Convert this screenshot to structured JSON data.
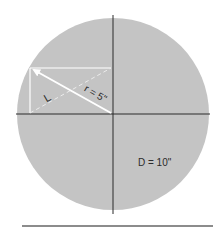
{
  "diagram": {
    "labels": {
      "leg": "L",
      "radius": "r = 5\"",
      "diameter": "D = 10\""
    },
    "colors": {
      "circle_fill": "#c4c4c4",
      "axis_line": "#2a2a2a",
      "triangle_line": "#ffffff",
      "baseline": "#1a1a1a"
    },
    "values": {
      "radius_in": 5,
      "diameter_in": 10
    }
  }
}
